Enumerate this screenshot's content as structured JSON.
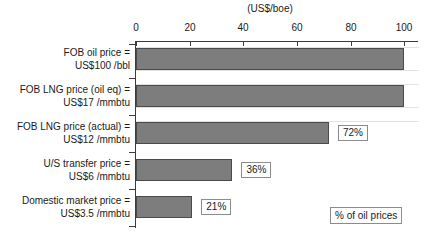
{
  "chart_data": {
    "type": "bar",
    "orientation": "horizontal",
    "title": "",
    "xlabel": "(US$/boe)",
    "ylabel": "",
    "xlim": [
      0,
      100
    ],
    "xticks": [
      0,
      20,
      40,
      60,
      80,
      100
    ],
    "xtick_labels": [
      "0",
      "20",
      "40",
      "60",
      "80",
      "100"
    ],
    "grid": false,
    "legend_position": "bottom-right",
    "legend_label": "% of oil prices",
    "bar_color": "#7d7d7d",
    "bar_edge_color": "#4a4a4a",
    "axis_color": "#3c3c3c",
    "categories": [
      "FOB oil price = US$100 /bbl",
      "FOB LNG price (oil eq) = US$17 /mmbtu",
      "FOB LNG price (actual) = US$12 /mmbtu",
      "U/S transfer price = US$6 /mmbtu",
      "Domestic market price = US$3.5 /mmbtu"
    ],
    "values": [
      100,
      100,
      72,
      36,
      21
    ],
    "data_labels": [
      "",
      "",
      "72%",
      "36%",
      "21%"
    ],
    "bars": [
      {
        "label_line1": "FOB oil price =",
        "label_line2": "US$100 /bbl",
        "value": 100,
        "data_label": ""
      },
      {
        "label_line1": "FOB LNG price (oil eq) =",
        "label_line2": "US$17 /mmbtu",
        "value": 100,
        "data_label": ""
      },
      {
        "label_line1": "FOB LNG price (actual) =",
        "label_line2": "US$12 /mmbtu",
        "value": 72,
        "data_label": "72%"
      },
      {
        "label_line1": "U/S transfer price =",
        "label_line2": "US$6 /mmbtu",
        "value": 36,
        "data_label": "36%"
      },
      {
        "label_line1": "Domestic market price =",
        "label_line2": "US$3.5 /mmbtu",
        "value": 21,
        "data_label": "21%"
      }
    ]
  }
}
